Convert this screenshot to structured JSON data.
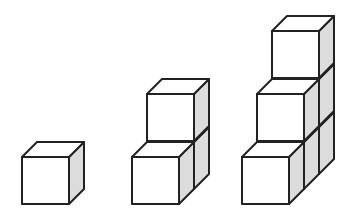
{
  "diagram": {
    "cube_size": 47,
    "depth_offset": [
      15,
      -15
    ],
    "colors": {
      "face": "#ffffff",
      "side_shade": "#dcdcdc",
      "edge": "#222222"
    },
    "figures": [
      {
        "name": "figure-1",
        "cube_count": 1,
        "cubes": [
          {
            "x": 22,
            "y": 157,
            "row": 0,
            "layer": 0
          }
        ]
      },
      {
        "name": "figure-2",
        "cube_count": 3,
        "cubes": [
          {
            "x": 147,
            "y": 142,
            "row": 1,
            "layer": 0
          },
          {
            "x": 147,
            "y": 94,
            "row": 1,
            "layer": 1
          },
          {
            "x": 132,
            "y": 157,
            "row": 0,
            "layer": 0
          }
        ]
      },
      {
        "name": "figure-3",
        "cube_count": 6,
        "cubes": [
          {
            "x": 272,
            "y": 127,
            "row": 2,
            "layer": 0
          },
          {
            "x": 272,
            "y": 79,
            "row": 2,
            "layer": 1
          },
          {
            "x": 272,
            "y": 31,
            "row": 2,
            "layer": 2
          },
          {
            "x": 257,
            "y": 142,
            "row": 1,
            "layer": 0
          },
          {
            "x": 257,
            "y": 94,
            "row": 1,
            "layer": 1
          },
          {
            "x": 242,
            "y": 157,
            "row": 0,
            "layer": 0
          }
        ]
      }
    ]
  }
}
